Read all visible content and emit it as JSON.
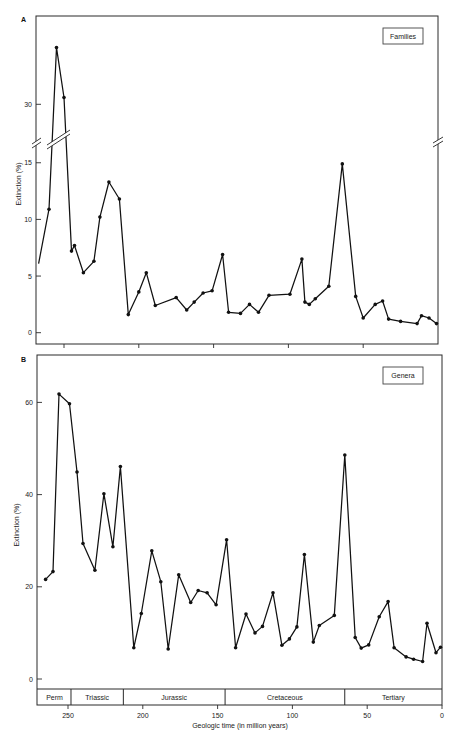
{
  "chart_data": [
    {
      "panel": "A",
      "panel_label": "A",
      "type": "line",
      "title": "Families",
      "legend": "Families",
      "legend_position": "upper right",
      "xlabel": "",
      "ylabel": "Extinction (%)",
      "xlim": [
        270,
        0
      ],
      "ylim": [
        -1,
        37.8
      ],
      "y_axis_break": [
        17,
        28
      ],
      "y_ticks": [
        0,
        5,
        10,
        15,
        30
      ],
      "x_ticks": [
        250,
        200,
        150,
        100,
        50
      ],
      "x_tick_labels_shown": false,
      "grid": false,
      "series": [
        {
          "name": "Families",
          "first_point_marker": false,
          "x": [
            267,
            260,
            255,
            250,
            245,
            243,
            237,
            230,
            226,
            220,
            213,
            207,
            200,
            195,
            189,
            175,
            168,
            163,
            157,
            151,
            144,
            140,
            132,
            126,
            120,
            113,
            99,
            91,
            89,
            86,
            82,
            73,
            64,
            55,
            50,
            42,
            37,
            33,
            25,
            14,
            11,
            6,
            1
          ],
          "y": [
            6.1,
            10.9,
            35.0,
            30.6,
            7.2,
            7.7,
            5.3,
            6.3,
            10.2,
            13.3,
            11.8,
            1.6,
            3.6,
            5.3,
            2.4,
            3.1,
            2.0,
            2.7,
            3.5,
            3.7,
            6.9,
            1.8,
            1.7,
            2.5,
            1.8,
            3.3,
            3.4,
            6.5,
            2.7,
            2.5,
            3.0,
            4.1,
            14.9,
            3.2,
            1.3,
            2.5,
            2.8,
            1.2,
            1.0,
            0.8,
            1.5,
            1.3,
            0.8
          ]
        }
      ]
    },
    {
      "panel": "B",
      "panel_label": "B",
      "type": "line",
      "title": "Genera",
      "legend": "Genera",
      "legend_position": "upper right",
      "xlabel": "Geologic time (in million years)",
      "ylabel": "Extinction (%)",
      "xlim": [
        270,
        0
      ],
      "ylim": [
        -2,
        70
      ],
      "y_ticks": [
        0,
        20,
        40,
        60
      ],
      "x_ticks": [
        250,
        200,
        150,
        100,
        50,
        0
      ],
      "x_tick_labels_shown": true,
      "grid": false,
      "periods": [
        {
          "name": "Perm",
          "from": 270,
          "to": 248
        },
        {
          "name": "Triassic",
          "from": 248,
          "to": 213
        },
        {
          "name": "Jurassic",
          "from": 213,
          "to": 145
        },
        {
          "name": "Cretaceous",
          "from": 145,
          "to": 65
        },
        {
          "name": "Tertiary",
          "from": 65,
          "to": 0
        }
      ],
      "series": [
        {
          "name": "Genera",
          "first_point_marker": true,
          "x": [
            265,
            260,
            256,
            249,
            244,
            240,
            232,
            226,
            220,
            215,
            206,
            201,
            194,
            188,
            183,
            176,
            168,
            163,
            157,
            151,
            144,
            138,
            131,
            125,
            120,
            113,
            107,
            102,
            97,
            92,
            86,
            82,
            72,
            65,
            58,
            54,
            49,
            42,
            36,
            32,
            24,
            19,
            13,
            10,
            4,
            1
          ],
          "y": [
            21.6,
            23.3,
            61.8,
            59.7,
            44.9,
            29.4,
            23.6,
            40.2,
            28.7,
            46.1,
            6.8,
            14.2,
            27.8,
            21.1,
            6.5,
            22.6,
            16.6,
            19.2,
            18.7,
            16.1,
            30.2,
            6.8,
            14.1,
            10.0,
            11.4,
            18.7,
            7.3,
            8.7,
            11.3,
            27.0,
            8.0,
            11.6,
            13.8,
            48.6,
            9.0,
            6.7,
            7.4,
            13.5,
            16.8,
            6.8,
            4.8,
            4.3,
            3.8,
            12.1,
            5.7,
            6.9
          ]
        }
      ]
    }
  ]
}
